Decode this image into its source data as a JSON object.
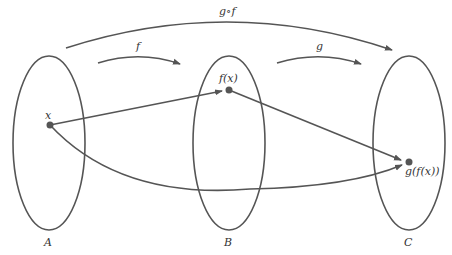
{
  "diagram": {
    "sets": [
      {
        "label": "A"
      },
      {
        "label": "B"
      },
      {
        "label": "C"
      }
    ],
    "points": {
      "x": "x",
      "fx": "f(x)",
      "gfx": "g(f(x))"
    },
    "maps": {
      "f": "f",
      "g": "g",
      "composite": "g∘f"
    },
    "colors": {
      "stroke": "#555555",
      "background": "#ffffff"
    }
  }
}
